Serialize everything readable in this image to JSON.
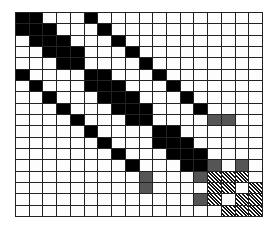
{
  "diagram": {
    "type": "block-matrix-grid",
    "rows": 18,
    "cols": 18,
    "legend": {
      "B": "black (filled)",
      "G": "gray (#555555)",
      "H": "hatched (diagonal stripes)",
      ".": "white (empty)"
    },
    "colors": {
      "black": "#000000",
      "gray": "#555555",
      "white": "#fdfdfd",
      "gridline": "#222222"
    },
    "matrix": [
      "BB...B............",
      "BBB...B...........",
      ".BBB...B..........",
      "..BBB...B.........",
      "...BB....B........",
      "B....BB...B.......",
      ".B...BBB...B......",
      "..B...BBB...B.....",
      "...B...BBB...B....",
      "....B...BB....GG..",
      ".....B....BB......",
      "......B...BBB.....",
      ".......B...BBB....",
      "........B...BBG.G.",
      ".........G...GHHH.",
      ".........G....HH.H",
      ".............GH.HH",
      "...............HHH"
    ]
  }
}
